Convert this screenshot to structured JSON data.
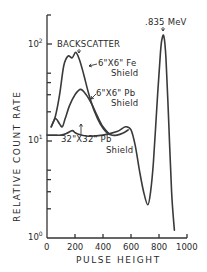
{
  "chart_data": {
    "type": "line",
    "title": "",
    "xlabel": "PULSE HEIGHT",
    "ylabel": "RELATIVE COUNT RATE",
    "xscale": "linear",
    "yscale": "log",
    "xlim": [
      0,
      1000
    ],
    "ylim": [
      1,
      160
    ],
    "x_ticks": [
      0,
      200,
      400,
      600,
      800,
      1000
    ],
    "x_tick_labels": [
      "0",
      "200",
      "400",
      "600",
      "800",
      "1000"
    ],
    "y_ticks": [
      1,
      10,
      100
    ],
    "y_tick_labels": [
      "10",
      "10",
      "10"
    ],
    "y_tick_exponents": [
      "0",
      "1",
      "2"
    ],
    "grid": false,
    "legend": null,
    "annotations": [
      {
        "text": ".835 MeV",
        "x": 820,
        "y": 120,
        "points_to": "photopeak"
      },
      {
        "text": "BACKSCATTER",
        "x": 200,
        "y": 80,
        "points_to": "backscatter peak"
      },
      {
        "text_line1": "6\"X6\" Fe",
        "text_line2": "Shield",
        "points_to": "Fe shield curve"
      },
      {
        "text_line1": "6\"X6\" Pb",
        "text_line2": "Shield",
        "points_to": "6x6 Pb shield curve"
      },
      {
        "text_line1": "32\"X32\" Pb",
        "text_line2": "Shield",
        "points_to": "32x32 Pb shield curve"
      }
    ],
    "series": [
      {
        "name": "6\"X6\" Fe Shield",
        "x": [
          30,
          60,
          90,
          120,
          150,
          180,
          205,
          230,
          260,
          300,
          340,
          380,
          420,
          460,
          500,
          540,
          580
        ],
        "values": [
          14,
          18,
          30,
          60,
          75,
          72,
          82,
          70,
          50,
          30,
          20,
          15,
          12.5,
          11.5,
          11.5,
          12,
          13
        ]
      },
      {
        "name": "6\"X6\" Pb Shield",
        "x": [
          30,
          60,
          90,
          110,
          130,
          160,
          200,
          240,
          280,
          320,
          360,
          400,
          440
        ],
        "values": [
          14,
          17,
          15,
          14,
          17,
          23,
          30,
          34,
          30,
          24,
          18,
          14,
          12
        ]
      },
      {
        "name": "32\"X32\" Pb Shield",
        "x": [
          0,
          50,
          100,
          140,
          180,
          200,
          220,
          260,
          300,
          400,
          500,
          560,
          600,
          630,
          660,
          690,
          720,
          740,
          760,
          790,
          810,
          820,
          835,
          850,
          870,
          890,
          910
        ],
        "values": [
          11.5,
          11.5,
          11.5,
          12,
          12.8,
          12.2,
          11.8,
          11.4,
          11.2,
          11.5,
          12.5,
          14,
          13,
          9,
          5,
          3,
          2.2,
          3,
          6,
          30,
          80,
          110,
          120,
          70,
          15,
          3,
          1.2
        ]
      }
    ]
  }
}
